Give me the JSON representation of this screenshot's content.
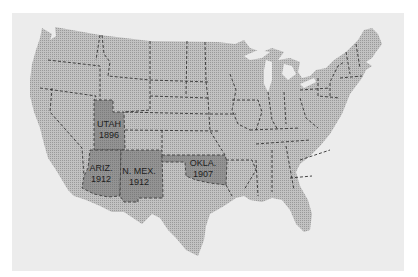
{
  "map": {
    "title": "",
    "subject": "United States map highlighting late-admitted western states",
    "colors": {
      "background": "#ffffff",
      "panel": "#ececec",
      "land": "#b4b4b4",
      "highlight": "#8a8a8a",
      "border": "#333333",
      "label": "#1e1e1e"
    },
    "highlighted_states": [
      {
        "id": "utah",
        "name": "UTAH",
        "year": "1896"
      },
      {
        "id": "arizona",
        "name": "ARIZ.",
        "year": "1912"
      },
      {
        "id": "new-mexico",
        "name": "N. MEX.",
        "year": "1912"
      },
      {
        "id": "oklahoma",
        "name": "OKLA.",
        "year": "1907"
      }
    ]
  }
}
